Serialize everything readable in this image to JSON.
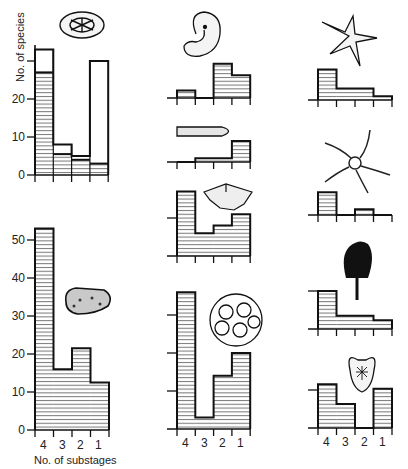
{
  "figure": {
    "ylabel": "No. of species",
    "xlabel": "No. of substages",
    "categories": [
      "4",
      "3",
      "2",
      "1"
    ]
  },
  "chart_data": [
    {
      "type": "bar",
      "id": "left-top",
      "organism": "diatom (oval)",
      "categories": [
        "4",
        "3",
        "2",
        "1"
      ],
      "series": [
        {
          "name": "total",
          "values": [
            33,
            8,
            5,
            30
          ]
        },
        {
          "name": "hatched",
          "values": [
            27,
            5.5,
            4,
            3
          ]
        }
      ],
      "yticks": [
        0,
        10,
        20,
        30
      ],
      "ylim": [
        0,
        35
      ],
      "ylabel": "No. of species",
      "xlabel": ""
    },
    {
      "type": "bar",
      "id": "left-bottom",
      "organism": "sponge-like",
      "categories": [
        "4",
        "3",
        "2",
        "1"
      ],
      "series": [
        {
          "name": "hatched",
          "values": [
            53,
            16,
            21.5,
            12.5
          ]
        }
      ],
      "yticks": [
        0,
        10,
        20,
        30,
        40,
        50
      ],
      "ylim": [
        0,
        55
      ],
      "xlabel": "No. of substages"
    },
    {
      "type": "bar",
      "id": "mid-1",
      "organism": "coiled gastropod",
      "categories": [
        "4",
        "3",
        "2",
        "1"
      ],
      "series": [
        {
          "name": "hatched",
          "values": [
            2,
            0,
            9,
            6
          ]
        }
      ]
    },
    {
      "type": "bar",
      "id": "mid-2",
      "organism": "belemnite",
      "categories": [
        "4",
        "3",
        "2",
        "1"
      ],
      "series": [
        {
          "name": "hatched",
          "values": [
            0,
            1,
            1,
            5.5
          ]
        }
      ]
    },
    {
      "type": "bar",
      "id": "mid-3",
      "organism": "coral",
      "categories": [
        "4",
        "3",
        "2",
        "1"
      ],
      "series": [
        {
          "name": "hatched",
          "values": [
            17,
            6,
            8,
            11
          ]
        }
      ],
      "yticks": [
        0,
        10
      ]
    },
    {
      "type": "bar",
      "id": "mid-4",
      "organism": "bryozoan",
      "categories": [
        "4",
        "3",
        "2",
        "1"
      ],
      "series": [
        {
          "name": "hatched",
          "values": [
            36,
            3,
            14,
            20
          ]
        }
      ],
      "yticks": [
        0,
        10,
        20,
        30
      ],
      "xlabel_ticks": [
        "4",
        "3",
        "2",
        "1"
      ]
    },
    {
      "type": "bar",
      "id": "right-1",
      "organism": "starfish",
      "categories": [
        "4",
        "3",
        "2",
        "1"
      ],
      "series": [
        {
          "name": "hatched",
          "values": [
            8,
            3,
            3,
            1
          ]
        }
      ]
    },
    {
      "type": "bar",
      "id": "right-2",
      "organism": "brittle star",
      "categories": [
        "4",
        "3",
        "2",
        "1"
      ],
      "series": [
        {
          "name": "hatched",
          "values": [
            6,
            0,
            1.5,
            0
          ]
        }
      ]
    },
    {
      "type": "bar",
      "id": "right-3",
      "organism": "crinoid",
      "categories": [
        "4",
        "3",
        "2",
        "1"
      ],
      "series": [
        {
          "name": "hatched",
          "values": [
            10,
            3.5,
            3.5,
            2.3
          ]
        }
      ],
      "yticks": [
        0,
        10
      ]
    },
    {
      "type": "bar",
      "id": "right-4",
      "organism": "echinoid",
      "categories": [
        "4",
        "3",
        "2",
        "1"
      ],
      "series": [
        {
          "name": "hatched",
          "values": [
            11.5,
            6.3,
            0,
            10.3
          ]
        }
      ],
      "yticks": [
        0,
        10
      ],
      "xlabel_ticks": [
        "4",
        "3",
        "2",
        "1"
      ]
    }
  ],
  "layout": {
    "scale_px_per_unit": 3.8,
    "panels": [
      {
        "x0": 35,
        "bw": 18.3,
        "base": 175,
        "ticks": true,
        "tickLabels": [
          null,
          "10",
          "20",
          null
        ],
        "axisLeft": true,
        "axisTop": 45
      },
      {
        "x0": 35,
        "bw": 18.5,
        "base": 430,
        "ticks": true,
        "tickLabels": [
          "0",
          "10",
          "20",
          "30",
          "40",
          "50"
        ],
        "axisLeft": true,
        "axisTop": 228
      },
      {
        "x0": 177,
        "bw": 18.3,
        "base": 98,
        "baseFrom": 163
      },
      {
        "x0": 177,
        "bw": 18.3,
        "base": 162,
        "baseFrom": 163
      },
      {
        "x0": 177,
        "bw": 18.3,
        "base": 256,
        "baseFrom": 167,
        "tickVals": [
          10
        ]
      },
      {
        "x0": 177,
        "bw": 18.3,
        "base": 429,
        "baseFrom": 167,
        "tickVals": [
          10,
          20,
          30
        ]
      },
      {
        "x0": 318,
        "bw": 18.5,
        "base": 100,
        "baseFrom": 311
      },
      {
        "x0": 318,
        "bw": 18.5,
        "base": 215,
        "baseFrom": 311
      },
      {
        "x0": 318,
        "bw": 18.5,
        "base": 329,
        "baseFrom": 311,
        "tickVals": [
          10
        ]
      },
      {
        "x0": 318,
        "bw": 18.5,
        "base": 428,
        "baseFrom": 311,
        "tickVals": [
          10
        ]
      }
    ]
  }
}
